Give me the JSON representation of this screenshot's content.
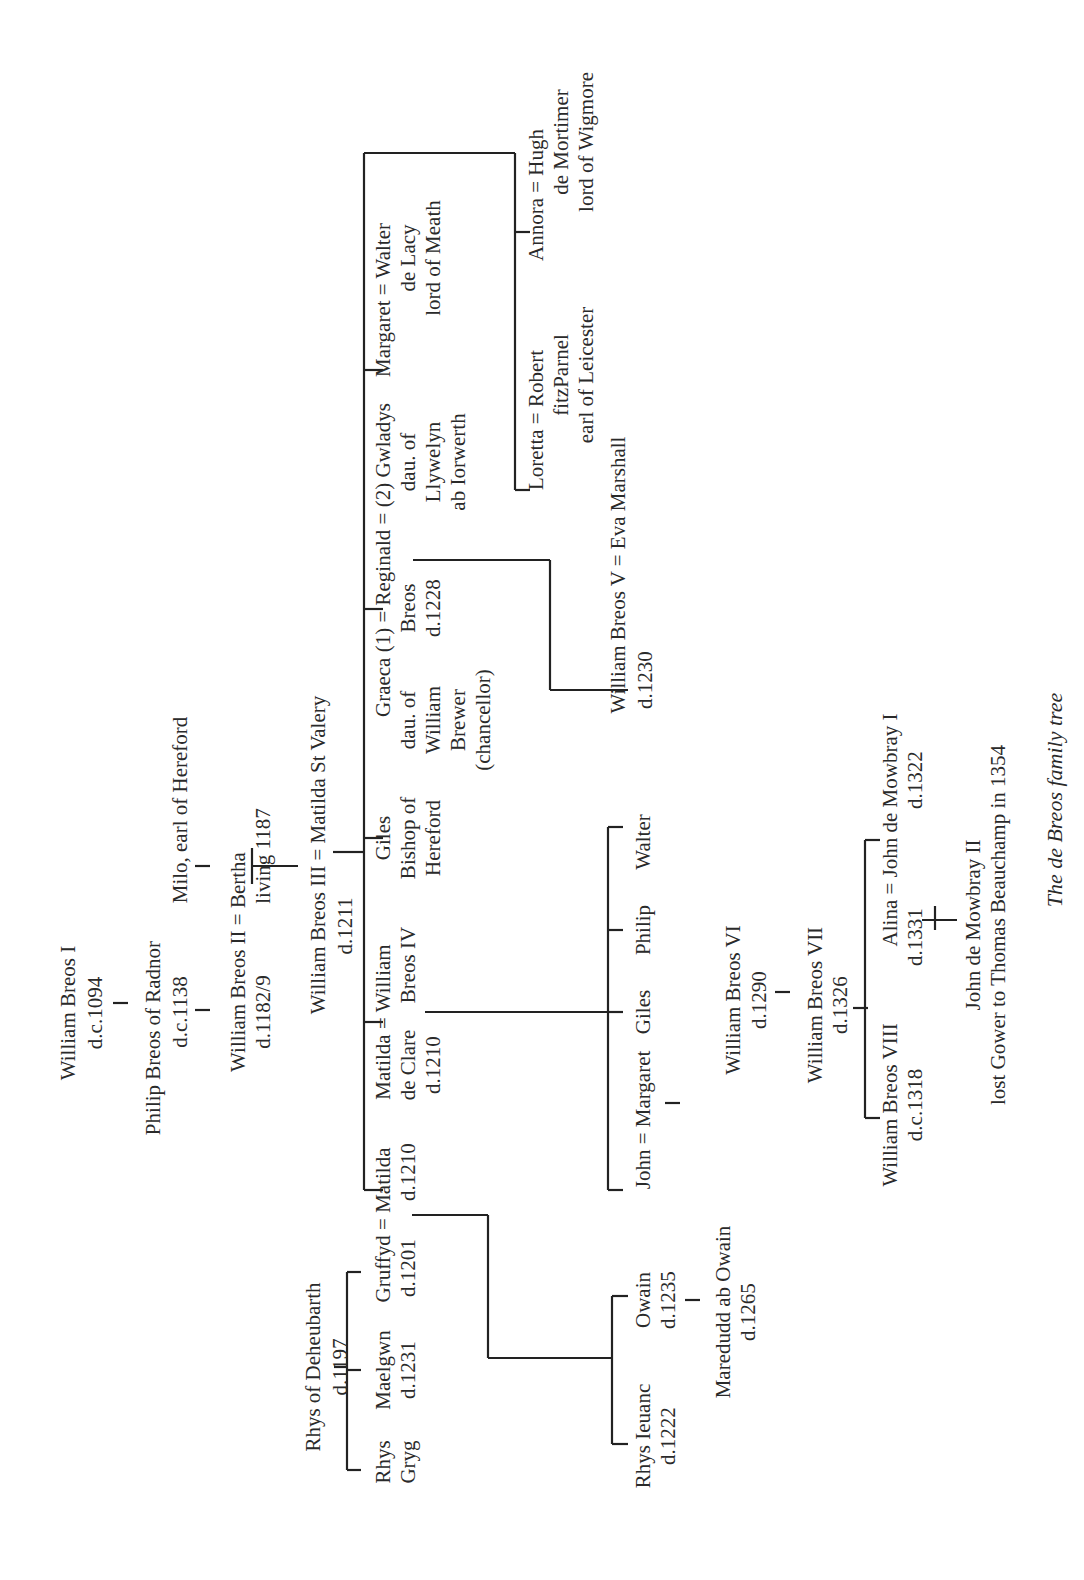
{
  "caption": "The de Breos family tree",
  "people": {
    "wb1": [
      "William Breos I",
      "d.c.1094"
    ],
    "philip": [
      "Philip Breos of Radnor",
      "d.c.1138"
    ],
    "milo": [
      "Milo, earl of Hereford"
    ],
    "wb2": [
      "William Breos II = Bertha",
      "d.1182/9"
    ],
    "bertha_note": [
      "living 1187"
    ],
    "wb3": [
      "William Breos III  = Matilda St Valery",
      "d.1211"
    ],
    "rhys_d": [
      "Rhys of Deheubarth",
      "d.1197"
    ],
    "rhys_gryg": [
      "Rhys",
      "Gryg"
    ],
    "maelgwn": [
      "Maelgwn",
      "d.1231"
    ],
    "gruffyd": [
      "Gruffyd = Matilda",
      "d.1201",
      "d.1210"
    ],
    "matilda_clare": [
      "Matilda = William",
      "de Clare",
      "d.1210",
      "Breos IV"
    ],
    "giles_bishop": [
      "Giles",
      "Bishop of",
      "Hereford"
    ],
    "graeca": [
      "Graeca (1) = Reginald = (2) Gwladys",
      "dau. of",
      "William",
      "Brewer",
      "(chancellor)",
      "Breos",
      "d.1228",
      "dau. of",
      "Llywelyn",
      "ab Iorwerth"
    ],
    "margaret_walter": [
      "Margaret = Walter",
      "de Lacy",
      "lord of Meath"
    ],
    "annora": [
      "Annora = Hugh",
      "de Mortimer",
      "lord of Wigmore"
    ],
    "loretta": [
      "Loretta = Robert",
      "fitzParnel",
      "earl of Leicester"
    ],
    "wb5": [
      "William Breos V = Eva Marshall",
      "d.1230"
    ],
    "rhys_ieuanc": [
      "Rhys Ieuanc",
      "d.1222"
    ],
    "owain": [
      "Owain",
      "d.1235"
    ],
    "maredudd": [
      "Maredudd ab Owain",
      "d.1265"
    ],
    "john_margaret": [
      "John = Margaret"
    ],
    "giles2": [
      "Giles"
    ],
    "philip2": [
      "Philip"
    ],
    "walter2": [
      "Walter"
    ],
    "wb6": [
      "William Breos VI",
      "d.1290"
    ],
    "wb7": [
      "William Breos VII",
      "d.1326"
    ],
    "wb8": [
      "William Breos VIII",
      "d.c.1318"
    ],
    "alina": [
      "Alina = John de Mowbray I",
      "d.1331",
      "d.1322"
    ],
    "mowbray2": [
      "John de Mowbray II",
      "lost Gower to Thomas Beauchamp in 1354"
    ]
  }
}
